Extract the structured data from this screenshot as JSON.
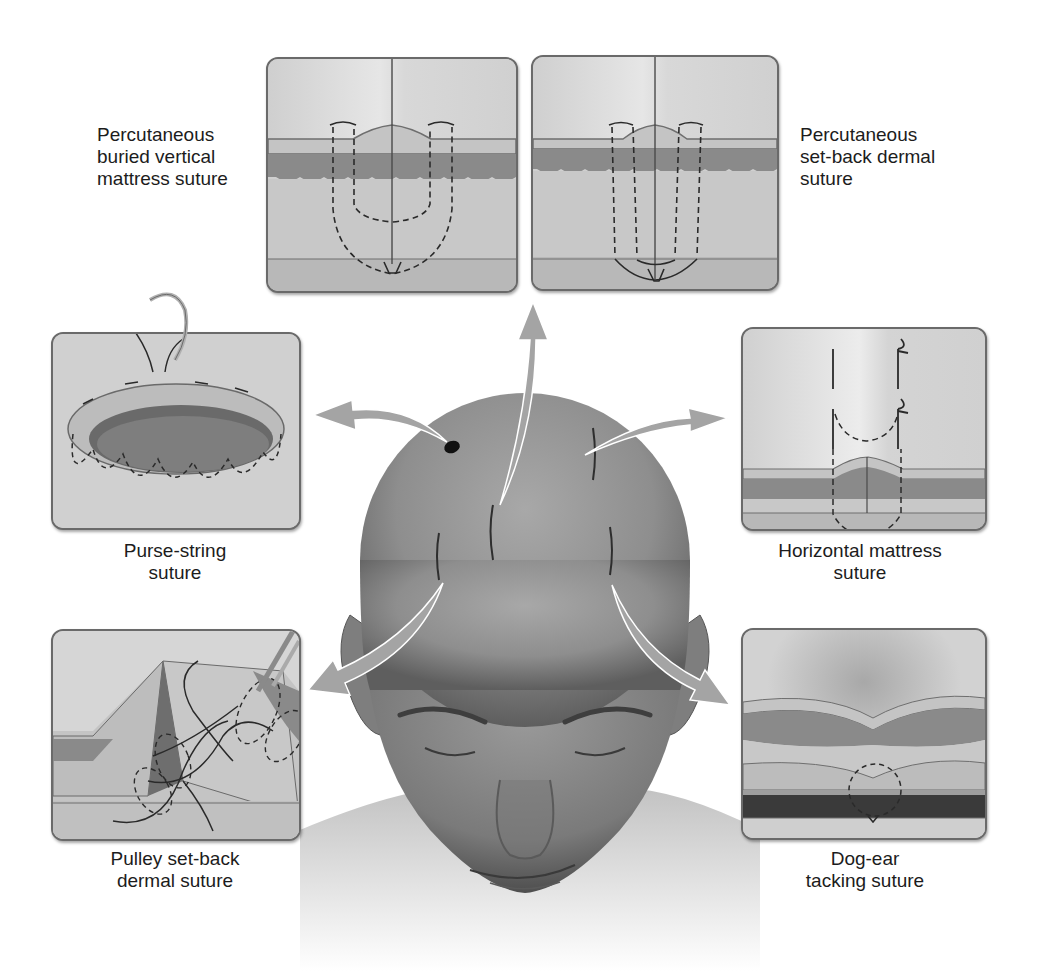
{
  "figure": {
    "panels": [
      {
        "id": "percutaneous-buried-vertical-mattress",
        "label_lines": [
          "Percutaneous",
          "buried vertical",
          "mattress suture"
        ]
      },
      {
        "id": "percutaneous-set-back-dermal",
        "label_lines": [
          "Percutaneous",
          "set-back dermal",
          "suture"
        ]
      },
      {
        "id": "purse-string",
        "label_lines": [
          "Purse-string",
          "suture"
        ]
      },
      {
        "id": "horizontal-mattress",
        "label_lines": [
          "Horizontal mattress",
          "suture"
        ]
      },
      {
        "id": "pulley-set-back-dermal",
        "label_lines": [
          "Pulley set-back",
          "dermal suture"
        ]
      },
      {
        "id": "dog-ear-tacking",
        "label_lines": [
          "Dog-ear",
          "tacking suture"
        ]
      }
    ]
  },
  "colors": {
    "background": "#ffffff",
    "panel_border": "#6a6a6a",
    "epidermis": "#bdbdbd",
    "dermis": "#8c8c8c",
    "subcutis": "#c9c9c9",
    "fascia": "#b0b0b0",
    "suture": "#2a2a2a",
    "arrow": "#9e9e9e",
    "skin": "#8a8a8a"
  }
}
